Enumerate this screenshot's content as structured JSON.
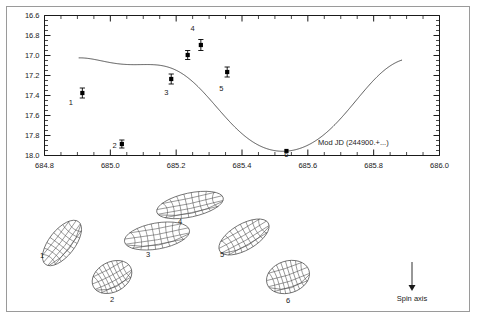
{
  "figure": {
    "background_color": "#ffffff",
    "frame_color": "#9a9a9a",
    "axis_color": "#1a1a1a",
    "curve_color": "#444444",
    "marker_color": "#000000",
    "mesh_color": "#555555"
  },
  "axes": {
    "xlabel": "Mod JD (244900.+...)",
    "ylabel": "",
    "x_ticks": [
      "684.8",
      "685.0",
      "685.2",
      "685.4",
      "685.6",
      "685.8",
      "686.0"
    ],
    "y_ticks": [
      "16.6",
      "16.8",
      "17.0",
      "17.2",
      "17.4",
      "17.6",
      "17.8",
      "18.0"
    ]
  },
  "annotations": {
    "spin_axis_label": "Spin axis"
  },
  "chart_data": {
    "type": "scatter",
    "title": "",
    "xlabel": "Mod JD (244900.+...)",
    "ylabel": "",
    "xlim": [
      684.8,
      686.0
    ],
    "ylim": [
      18.0,
      16.6
    ],
    "y_inverted": true,
    "grid": false,
    "legend": "none",
    "x_ticks": [
      684.8,
      685.0,
      685.2,
      685.4,
      685.6,
      685.8,
      686.0
    ],
    "y_ticks": [
      16.6,
      16.8,
      17.0,
      17.2,
      17.4,
      17.6,
      17.8,
      18.0
    ],
    "series": [
      {
        "name": "Observed photometry",
        "type": "scatter",
        "marker": "filled-square",
        "errorbars": true,
        "points": [
          {
            "label": "1",
            "x": 684.915,
            "y": 17.375,
            "yerr": 0.05,
            "label_dx": -0.035,
            "label_dy": 0.12
          },
          {
            "label": "2",
            "x": 685.035,
            "y": 17.885,
            "yerr": 0.04,
            "label_dx": -0.022,
            "label_dy": 0.04
          },
          {
            "label": "3",
            "x": 685.185,
            "y": 17.235,
            "yerr": 0.05,
            "label_dx": -0.015,
            "label_dy": 0.16
          },
          {
            "label": "4",
            "x": 685.275,
            "y": 16.895,
            "yerr": 0.055,
            "label_dx": -0.025,
            "label_dy": -0.14
          },
          {
            "label": "5",
            "x": 685.355,
            "y": 17.165,
            "yerr": 0.05,
            "label_dx": -0.018,
            "label_dy": 0.19
          },
          {
            "label": "6",
            "x": 685.535,
            "y": 17.955,
            "yerr": 0.0,
            "label_dx": 0.0,
            "label_dy": 0.055
          }
        ],
        "extra_points": [
          {
            "x": 685.235,
            "y": 16.995,
            "yerr": 0.045
          }
        ]
      },
      {
        "name": "Model lightcurve",
        "type": "line",
        "x_start": 684.905,
        "x_end": 685.885,
        "description": "double-peaked rotational lightcurve fit"
      }
    ]
  },
  "shape_models": [
    {
      "label": "1",
      "cx": 62,
      "cy": 243,
      "rx": 27,
      "ry": 13,
      "rot": -52,
      "label_x": 42,
      "label_y": 258
    },
    {
      "label": "2",
      "cx": 112,
      "cy": 277,
      "rx": 21,
      "ry": 15,
      "rot": -28,
      "label_x": 112,
      "label_y": 302
    },
    {
      "label": "3",
      "cx": 157,
      "cy": 236,
      "rx": 33,
      "ry": 13,
      "rot": -10,
      "label_x": 148,
      "label_y": 257
    },
    {
      "label": "4",
      "cx": 190,
      "cy": 205,
      "rx": 34,
      "ry": 12,
      "rot": -12,
      "label_x": 180,
      "label_y": 224
    },
    {
      "label": "5",
      "cx": 244,
      "cy": 237,
      "rx": 28,
      "ry": 13,
      "rot": -30,
      "label_x": 222,
      "label_y": 257
    },
    {
      "label": "6",
      "cx": 288,
      "cy": 277,
      "rx": 22,
      "ry": 16,
      "rot": -18,
      "label_x": 288,
      "label_y": 303
    }
  ]
}
